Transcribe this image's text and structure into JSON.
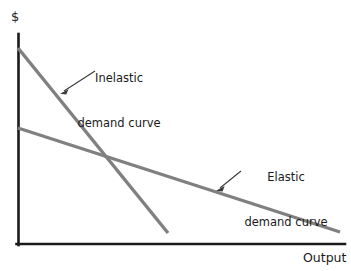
{
  "figure": {
    "background_color": "#ffffff",
    "axis_color": "#1a1a1a",
    "curve_color": "#808080",
    "annotation_color": "#3a3a3a",
    "text_color": "#1a1a1a"
  },
  "axes": {
    "y_axis_title": "$",
    "x_axis_title": "Output",
    "origin": {
      "x": 18,
      "y": 244
    },
    "y_axis_top": {
      "x": 18,
      "y": 34
    },
    "x_axis_right": {
      "x": 345,
      "y": 244
    }
  },
  "annotations": {
    "inelastic": {
      "line1": "Inelastic",
      "line2": "demand curve",
      "arrow_from": {
        "x": 95,
        "y": 71
      },
      "arrow_to": {
        "x": 61,
        "y": 93
      }
    },
    "elastic": {
      "line1": "Elastic",
      "line2": "demand curve",
      "arrow_from": {
        "x": 241,
        "y": 171
      },
      "arrow_to": {
        "x": 217,
        "y": 190
      }
    }
  },
  "chart_data": {
    "type": "line",
    "title": "",
    "subtitle": "",
    "xlabel": "Output",
    "ylabel": "$",
    "grid": false,
    "legend": "annotated-inline",
    "xlim": [
      0,
      345
    ],
    "ylim": [
      0,
      244
    ],
    "series": [
      {
        "name": "Inelastic demand curve",
        "color": "#808080",
        "points": [
          {
            "x": 18,
            "y": 48
          },
          {
            "x": 168,
            "y": 233
          }
        ],
        "slope": "steep",
        "description": "Steeply downward sloping straight demand curve from high price intercept to low output"
      },
      {
        "name": "Elastic demand curve",
        "color": "#808080",
        "points": [
          {
            "x": 18,
            "y": 128
          },
          {
            "x": 340,
            "y": 232
          }
        ],
        "slope": "shallow",
        "description": "Gently downward sloping straight demand curve extending far along the output axis"
      }
    ],
    "intersection": {
      "x": 105,
      "y": 157
    }
  }
}
